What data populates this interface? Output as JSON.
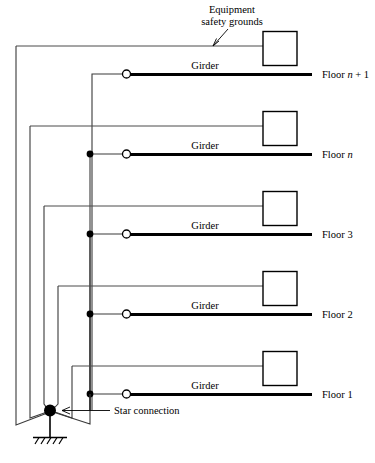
{
  "figure": {
    "type": "electrical-grounding-diagram",
    "title_annotation": "Equipment safety grounds",
    "star_annotation": "Star connection",
    "girder_label": "Girder",
    "colors": {
      "girder": "#000000",
      "wire": "#4a4a4a",
      "riser": "#3a3a3a",
      "background": "#ffffff",
      "node_fill": "#000000",
      "ring_fill": "#ffffff"
    }
  },
  "floors": [
    {
      "id": "floor-n-plus-1",
      "label": "Floor n + 1",
      "label_prefix": "Floor ",
      "label_italic": "n",
      "label_suffix": " + 1",
      "girder_label": "Girder",
      "has_equipment_box": true,
      "has_bus_dot": false,
      "has_girder_ring": true
    },
    {
      "id": "floor-n",
      "label": "Floor n",
      "label_prefix": "Floor ",
      "label_italic": "n",
      "label_suffix": "",
      "girder_label": "Girder",
      "has_equipment_box": true,
      "has_bus_dot": true,
      "has_girder_ring": true
    },
    {
      "id": "floor-3",
      "label": "Floor 3",
      "label_prefix": "Floor ",
      "label_italic": "",
      "label_suffix": "3",
      "girder_label": "Girder",
      "has_equipment_box": true,
      "has_bus_dot": true,
      "has_girder_ring": true
    },
    {
      "id": "floor-2",
      "label": "Floor 2",
      "label_prefix": "Floor ",
      "label_italic": "",
      "label_suffix": "2",
      "girder_label": "Girder",
      "has_equipment_box": true,
      "has_bus_dot": true,
      "has_girder_ring": true
    },
    {
      "id": "floor-1",
      "label": "Floor 1",
      "label_prefix": "Floor ",
      "label_italic": "",
      "label_suffix": "1",
      "girder_label": "Girder",
      "has_equipment_box": true,
      "has_bus_dot": true,
      "has_girder_ring": true
    }
  ],
  "annotations": {
    "equipment_safety_grounds_line1": "Equipment",
    "equipment_safety_grounds_line2": "safety grounds",
    "star_connection": "Star connection"
  },
  "symbols": {
    "ground": "earth-ground-symbol",
    "star_node": "star-connection-node",
    "bus_node": "bus-tap-node",
    "girder_terminal": "girder-terminal-ring"
  }
}
